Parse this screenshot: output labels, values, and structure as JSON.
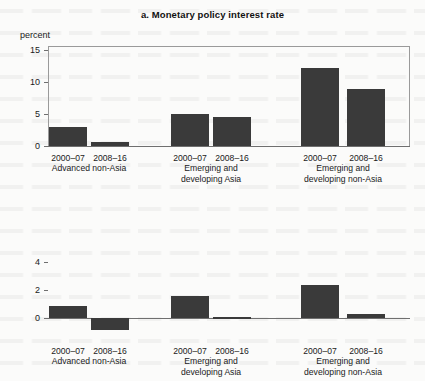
{
  "figure": {
    "unit_label_a": "percent",
    "unit_label_b": "percent"
  },
  "chart_data": [
    {
      "type": "bar",
      "panel": "a",
      "title": "a. Monetary policy interest rate",
      "xlabel": "",
      "ylabel": "percent",
      "ylim": [
        0,
        16
      ],
      "yticks": [
        0,
        5,
        10,
        15
      ],
      "ytick_labels": [
        "0",
        "5",
        "10",
        "15"
      ],
      "grid": false,
      "legend": "none",
      "groups": [
        {
          "name": "Advanced non-Asia",
          "name_lines": [
            "Advanced non-Asia"
          ],
          "bars": [
            {
              "period": "2000–07",
              "value": 3.0
            },
            {
              "period": "2008–16",
              "value": 0.6
            }
          ]
        },
        {
          "name": "Emerging and developing Asia",
          "name_lines": [
            "Emerging and",
            "developing Asia"
          ],
          "bars": [
            {
              "period": "2000–07",
              "value": 5.0
            },
            {
              "period": "2008–16",
              "value": 4.6
            }
          ]
        },
        {
          "name": "Emerging and developing non-Asia",
          "name_lines": [
            "Emerging and",
            "developing non-Asia"
          ],
          "bars": [
            {
              "period": "2000–07",
              "value": 12.3
            },
            {
              "period": "2008–16",
              "value": 8.9
            }
          ]
        }
      ],
      "categories": [
        "Advanced non-Asia 2000–07",
        "Advanced non-Asia 2008–16",
        "Emerging and developing Asia 2000–07",
        "Emerging and developing Asia 2008–16",
        "Emerging and developing non-Asia 2000–07",
        "Emerging and developing non-Asia 2008–16"
      ],
      "values": [
        3.0,
        0.6,
        5.0,
        4.6,
        12.3,
        8.9
      ],
      "bar_color": "#3a3a3a"
    },
    {
      "type": "bar",
      "panel": "b",
      "title": "b. Real interest rate",
      "xlabel": "",
      "ylabel": "percent",
      "ylim": [
        -1.6,
        5.4
      ],
      "yticks": [
        0,
        2,
        4
      ],
      "ytick_labels": [
        "0",
        "2",
        "4"
      ],
      "grid": false,
      "legend": "none",
      "groups": [
        {
          "name": "Advanced non-Asia",
          "name_lines": [
            "Advanced non-Asia"
          ],
          "bars": [
            {
              "period": "2000–07",
              "value": 0.85
            },
            {
              "period": "2008–16",
              "value": -0.85
            }
          ]
        },
        {
          "name": "Emerging and developing Asia",
          "name_lines": [
            "Emerging and",
            "developing Asia"
          ],
          "bars": [
            {
              "period": "2000–07",
              "value": 1.6
            },
            {
              "period": "2008–16",
              "value": 0.05
            }
          ]
        },
        {
          "name": "Emerging and developing non-Asia",
          "name_lines": [
            "Emerging and",
            "developing non-Asia"
          ],
          "bars": [
            {
              "period": "2000–07",
              "value": 2.35
            },
            {
              "period": "2008–16",
              "value": 0.3
            }
          ]
        }
      ],
      "categories": [
        "Advanced non-Asia 2000–07",
        "Advanced non-Asia 2008–16",
        "Emerging and developing Asia 2000–07",
        "Emerging and developing Asia 2008–16",
        "Emerging and developing non-Asia 2000–07",
        "Emerging and developing non-Asia 2008–16"
      ],
      "values": [
        0.85,
        -0.85,
        1.6,
        0.05,
        2.35,
        0.3
      ],
      "bar_color": "#3a3a3a"
    }
  ],
  "panel_a": {
    "title": "a. Monetary policy interest rate",
    "unit": "percent",
    "yticks": [
      "15",
      "10",
      "5",
      "0"
    ],
    "period_labels": [
      "2000–07",
      "2008–16",
      "2000–07",
      "2008–16",
      "2000–07",
      "2008–16"
    ],
    "group_labels": [
      "Advanced non-Asia",
      "Emerging and\ndeveloping Asia",
      "Emerging and\ndeveloping non-Asia"
    ]
  },
  "panel_b": {
    "title": "b. Real interest rate",
    "unit": "percent",
    "yticks": [
      "4",
      "2",
      "0"
    ],
    "period_labels": [
      "2000–07",
      "2008–16",
      "2000–07",
      "2008–16",
      "2000–07",
      "2008–16"
    ],
    "group_labels": [
      "Advanced non-Asia",
      "Emerging and\ndeveloping Asia",
      "Emerging and\ndeveloping non-Asia"
    ]
  }
}
